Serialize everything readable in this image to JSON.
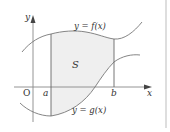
{
  "diagram": {
    "colors": {
      "background": "#ffffff",
      "curve": "#777777",
      "axis": "#888888",
      "shade": "#efefef",
      "border": "#c8c8c8",
      "text": "#333333"
    },
    "labels": {
      "y_axis": "y",
      "x_axis": "x",
      "origin": "O",
      "a": "a",
      "b": "b",
      "region": "S",
      "upper_curve": "y = f(x)",
      "lower_curve": "y = g(x)"
    }
  }
}
